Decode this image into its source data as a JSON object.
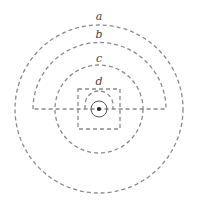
{
  "diagram": {
    "labels": {
      "a": "a",
      "b": "b",
      "c": "c",
      "d": "d"
    },
    "colors": {
      "stroke": "#8a8a8a",
      "solid": "#555555",
      "dot": "#222222"
    }
  }
}
